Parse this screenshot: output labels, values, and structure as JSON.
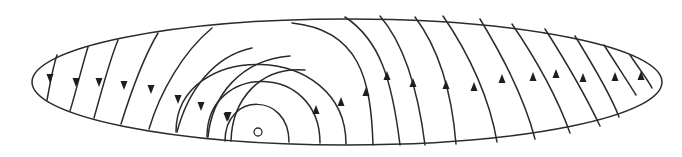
{
  "diagram": {
    "title": "",
    "colors": {
      "line": "#2b2b2b",
      "arrow": "#1e1e1e",
      "background": "#ffffff"
    },
    "boundary": {
      "shape": "ellipse",
      "cx": 347,
      "cy": 82,
      "rx": 315,
      "ry": 63
    },
    "point": {
      "label": "",
      "cx": 258,
      "cy": 132,
      "r": 4
    },
    "streamlines_left": {
      "direction": "downward",
      "paths": [
        "M57,55 C52,70 50,85 47,100",
        "M88,47 C82,66 77,88 70,111",
        "M118,40 C109,62 102,90 94,118",
        "M158,33 C143,58 131,92 121,124",
        "M212,28 C183,52 160,92 149,129",
        "M252,48 C214,56 188,90 177,132",
        "M290,56 C240,60 212,96 208,137",
        "M305,70 C260,66 232,100 231,141"
      ],
      "arrows": [
        [
          50,
          78
        ],
        [
          76,
          82
        ],
        [
          99,
          82
        ],
        [
          124,
          85
        ],
        [
          151,
          89
        ],
        [
          178,
          99
        ],
        [
          201,
          106
        ],
        [
          228,
          116
        ]
      ]
    },
    "streamlines_center": {
      "direction": "counterclockwise semicircles",
      "paths": [
        "M225,141 C225,92 289,92 289,142",
        "M207,137 C207,62 320,62 320,143",
        "M176,132 C176,40 346,40 346,144",
        "M292,23 C360,30 371,80 373,145"
      ],
      "arrows": [
        [
          227,
          117
        ],
        [
          316,
          110
        ],
        [
          341,
          102
        ],
        [
          366,
          92
        ]
      ]
    },
    "streamlines_right": {
      "direction": "upward",
      "paths": [
        "M345,17 C380,40 392,80 400,145",
        "M380,16 C405,45 418,90 425,145",
        "M415,17 C440,50 452,95 456,144",
        "M443,16 C470,55 490,100 497,142",
        "M480,19 C505,60 525,100 535,139",
        "M512,24 C540,65 560,105 570,133",
        "M545,29 C570,68 590,105 600,126",
        "M575,36 C596,70 612,98 619,117",
        "M604,45 C620,70 630,85 636,95",
        "M630,55 C640,70 648,80 652,88"
      ],
      "arrows": [
        [
          387,
          76
        ],
        [
          413,
          83
        ],
        [
          446,
          85
        ],
        [
          474,
          87
        ],
        [
          502,
          79
        ],
        [
          533,
          77
        ],
        [
          556,
          74
        ],
        [
          583,
          78
        ],
        [
          615,
          77
        ],
        [
          641,
          76
        ]
      ]
    }
  }
}
